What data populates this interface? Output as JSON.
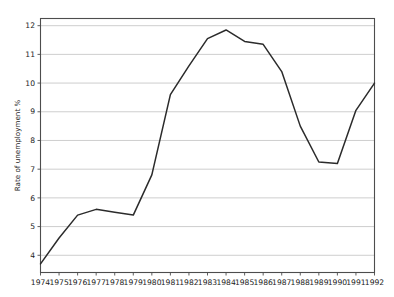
{
  "chart_data": {
    "type": "line",
    "title": "",
    "xlabel": "",
    "ylabel": "Rate of unemployment %",
    "x": [
      1974,
      1975,
      1976,
      1977,
      1978,
      1979,
      1980,
      1981,
      1982,
      1983,
      1984,
      1985,
      1986,
      1987,
      1988,
      1989,
      1990,
      1991,
      1992
    ],
    "categories": [
      "1974",
      "1975",
      "1976",
      "1977",
      "1978",
      "1979",
      "1980",
      "1981",
      "1982",
      "1983",
      "1984",
      "1985",
      "1986",
      "1987",
      "1988",
      "1989",
      "1990",
      "1991",
      "1992"
    ],
    "values": [
      3.7,
      4.6,
      5.4,
      5.6,
      5.5,
      5.4,
      6.8,
      9.6,
      10.6,
      11.55,
      11.85,
      11.45,
      11.35,
      10.4,
      8.5,
      7.25,
      7.2,
      9.05,
      10.0
    ],
    "series": [
      {
        "name": "Rate of unemployment %",
        "values": [
          3.7,
          4.6,
          5.4,
          5.6,
          5.5,
          5.4,
          6.8,
          9.6,
          10.6,
          11.55,
          11.85,
          11.45,
          11.35,
          10.4,
          8.5,
          7.25,
          7.2,
          9.05,
          10.0
        ]
      }
    ],
    "ylim": [
      3.4,
      12.25
    ],
    "xlim": [
      1974,
      1992
    ],
    "yticks": [
      4,
      5,
      6,
      7,
      8,
      9,
      10,
      11,
      12
    ],
    "ytick_labels": [
      "4",
      "5",
      "6",
      "7",
      "8",
      "9",
      "10",
      "11",
      "12"
    ],
    "xticks": [
      1974,
      1975,
      1976,
      1977,
      1978,
      1979,
      1980,
      1981,
      1982,
      1983,
      1984,
      1985,
      1986,
      1987,
      1988,
      1989,
      1990,
      1991,
      1992
    ],
    "xtick_labels": [
      "1974",
      "1975",
      "1976",
      "1977",
      "1978",
      "1979",
      "1980",
      "1981",
      "1982",
      "1983",
      "1984",
      "1985",
      "1986",
      "1987",
      "1988",
      "1989",
      "1990",
      "1991",
      "1992"
    ],
    "grid": "horizontal",
    "legend": "none",
    "line_color": "#2b2b2b",
    "grid_color": "#c8c8c8",
    "background": "#ffffff"
  }
}
